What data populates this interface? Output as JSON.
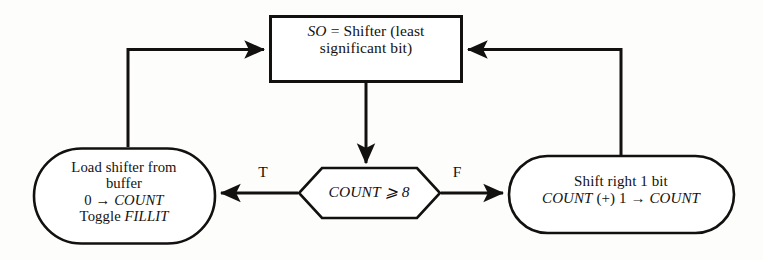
{
  "diagram": {
    "type": "flowchart",
    "nodes": {
      "process_box": {
        "shape": "rectangle",
        "name": "so-shifter-box",
        "lines": [
          {
            "italic_prefix": "SO",
            "rest": " = Shifter (least"
          },
          {
            "italic_prefix": "",
            "rest": "significant bit)"
          }
        ],
        "text": "SO = Shifter (least significant bit)"
      },
      "left_oval": {
        "shape": "stadium",
        "name": "load-shifter-oval",
        "lines": [
          "Load shifter from",
          "buffer",
          "0 → COUNT",
          "Toggle FILLIT"
        ],
        "line3_plain": "0 → ",
        "line3_italic": "COUNT",
        "line4_plain": "Toggle ",
        "line4_italic": "FILLIT"
      },
      "decision": {
        "shape": "hexagon",
        "name": "count-decision",
        "italic_text": "COUNT",
        "operator": "⩾",
        "value": "8",
        "text": "COUNT ⩾ 8"
      },
      "right_oval": {
        "shape": "stadium",
        "name": "shift-right-oval",
        "lines": [
          "Shift right 1 bit",
          "COUNT (+) 1 → COUNT"
        ],
        "line1": "Shift right 1 bit",
        "line2_italic_a": "COUNT",
        "line2_plain": " (+) 1 → ",
        "line2_italic_b": "COUNT"
      }
    },
    "edges": [
      {
        "name": "edge-box-to-decision",
        "from": "process_box",
        "to": "decision",
        "label": ""
      },
      {
        "name": "edge-decision-true",
        "from": "decision",
        "to": "left_oval",
        "label": "T"
      },
      {
        "name": "edge-decision-false",
        "from": "decision",
        "to": "right_oval",
        "label": "F"
      },
      {
        "name": "edge-left-oval-to-box",
        "from": "left_oval",
        "to": "process_box",
        "label": ""
      },
      {
        "name": "edge-right-oval-to-box",
        "from": "right_oval",
        "to": "process_box",
        "label": ""
      }
    ],
    "labels": {
      "true_branch": "T",
      "false_branch": "F"
    },
    "colors": {
      "stroke": "#13110f",
      "background": "#fdfdfc",
      "text": "#13110f"
    }
  }
}
